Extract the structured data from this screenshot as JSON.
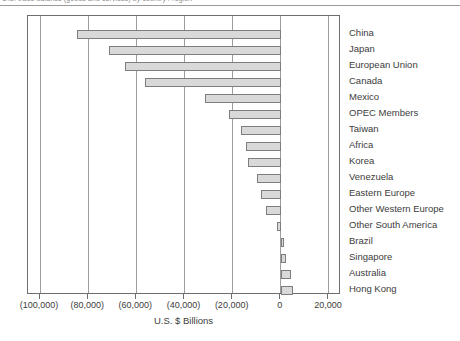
{
  "caption": {
    "text": "U.S. trade balance (goods and services) by country / region"
  },
  "chart_data": {
    "type": "bar",
    "orientation": "horizontal",
    "title": "",
    "subtitle": "",
    "xlabel": "U.S. $ Billions",
    "ylabel": "",
    "xlim": [
      -105000,
      25000
    ],
    "xticks": [
      -100000,
      -80000,
      -60000,
      -40000,
      -20000,
      0,
      20000
    ],
    "xticklabels": [
      "(100,000)",
      "(80,000)",
      "(60,000)",
      "(40,000)",
      "(20,000)",
      "0",
      "20,000"
    ],
    "grid": true,
    "grid_axis": "x",
    "legend": "none",
    "bar_fill": "#d9d9d9",
    "bar_stroke": "#7d7d7d",
    "categories": [
      "China",
      "Japan",
      "European Union",
      "Canada",
      "Mexico",
      "OPEC Members",
      "Taiwan",
      "Africa",
      "Korea",
      "Venezuela",
      "Eastern Europe",
      "Other Western Europe",
      "Other South America",
      "Brazil",
      "Singapore",
      "Australia",
      "Hong Kong"
    ],
    "values": [
      -84600,
      -71500,
      -64800,
      -56500,
      -31500,
      -21500,
      -16500,
      -14600,
      -13500,
      -10000,
      -8100,
      -6200,
      -1500,
      1500,
      2300,
      4200,
      5000
    ]
  }
}
